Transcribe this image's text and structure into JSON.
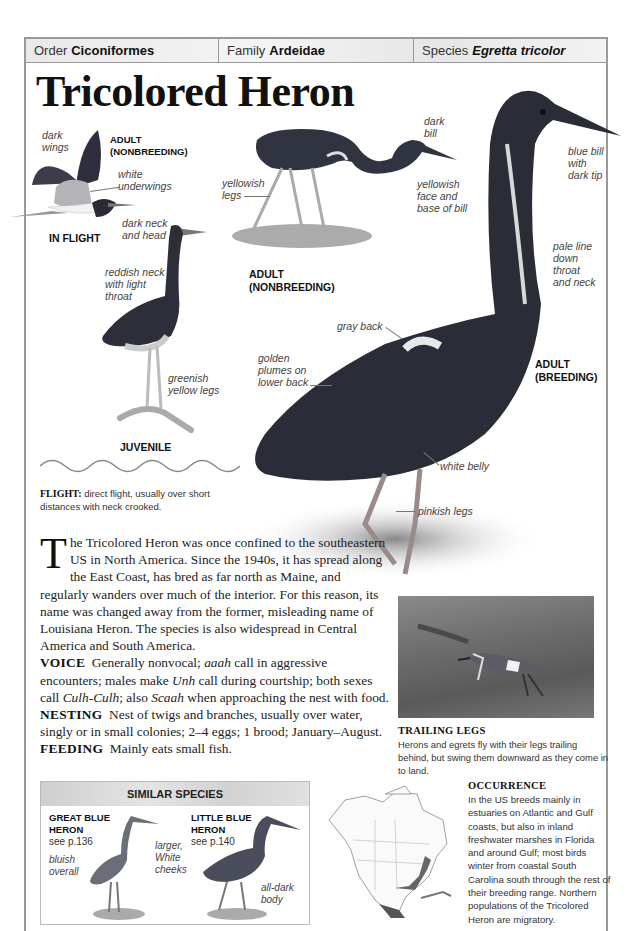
{
  "taxonomy": {
    "order_label": "Order",
    "order_value": "Ciconiformes",
    "family_label": "Family",
    "family_value": "Ardeidae",
    "species_label": "Species",
    "species_value": "Egretta tricolor"
  },
  "title": "Tricolored Heron",
  "illustrations": {
    "in_flight": {
      "caption": "IN FLIGHT",
      "age_label_1": "ADULT",
      "age_label_2": "(NONBREEDING)",
      "labels": {
        "dark_wings_1": "dark",
        "dark_wings_2": "wings",
        "white_underwings_1": "white",
        "white_underwings_2": "underwings",
        "dark_neck_1": "dark neck",
        "dark_neck_2": "and head"
      }
    },
    "adult_nonbreeding": {
      "caption_1": "ADULT",
      "caption_2": "(NONBREEDING)",
      "labels": {
        "yellowish_legs_1": "yellowish",
        "yellowish_legs_2": "legs",
        "dark_bill_1": "dark",
        "dark_bill_2": "bill",
        "face_1": "yellowish",
        "face_2": "face and",
        "face_3": "base of bill"
      }
    },
    "juvenile": {
      "caption": "JUVENILE",
      "labels": {
        "neck_1": "reddish neck",
        "neck_2": "with light",
        "neck_3": "throat",
        "legs_1": "greenish",
        "legs_2": "yellow legs"
      }
    },
    "adult_breeding": {
      "caption_1": "ADULT",
      "caption_2": "(BREEDING)",
      "labels": {
        "bill_1": "blue bill",
        "bill_2": "with",
        "bill_3": "dark tip",
        "pale_1": "pale line",
        "pale_2": "down",
        "pale_3": "throat",
        "pale_4": "and neck",
        "gray_back": "gray back",
        "golden_1": "golden",
        "golden_2": "plumes on",
        "golden_3": "lower back",
        "white_belly": "white belly",
        "pinkish_legs": "pinkish legs"
      }
    }
  },
  "flight": {
    "heading": "FLIGHT:",
    "text": "direct flight, usually over short distances with neck crooked."
  },
  "description": {
    "dropcap": "T",
    "intro": "he Tricolored Heron was once confined to the southeastern US in North America. Since the 1940s, it has spread along the East Coast, has bred as far north as Maine, and regularly wanders over much of the interior. For this reason, its name was changed away from the former, misleading name of Louisiana Heron. The species is also widespread in Central America and South America.",
    "voice_label": "VOICE",
    "voice_1": "Generally nonvocal;",
    "voice_aaah": "aaah",
    "voice_2": "call in aggressive encounters; males make",
    "voice_unh": "Unh",
    "voice_3": "call during courtship; both sexes call",
    "voice_culh": "Culh-Culh",
    "voice_4": "; also",
    "voice_scaah": "Scaah",
    "voice_5": "when approaching the nest with food.",
    "nesting_label": "NESTING",
    "nesting": "Nest of twigs and branches, usually over water, singly or in small colonies; 2–4 eggs; 1 brood; January–August.",
    "feeding_label": "FEEDING",
    "feeding": "Mainly eats small fish."
  },
  "trailing_legs": {
    "title": "TRAILING LEGS",
    "text": "Herons and egrets fly with their legs trailing behind, but swing them downward as they come in to land."
  },
  "similar_species": {
    "heading": "SIMILAR SPECIES",
    "great_blue": {
      "name_1": "GREAT BLUE",
      "name_2": "HERON",
      "page": "see p.136",
      "label_bluish_1": "bluish",
      "label_bluish_2": "overall",
      "label_larger_1": "larger,",
      "label_larger_2": "White",
      "label_larger_3": "cheeks"
    },
    "little_blue": {
      "name_1": "LITTLE BLUE",
      "name_2": "HERON",
      "page": "see p.140",
      "label_body_1": "all-dark",
      "label_body_2": "body"
    }
  },
  "occurrence": {
    "title": "OCCURRENCE",
    "text": "In the US breeds mainly in estuaries on Atlantic and Gulf coasts, but also in inland freshwater marshes in Florida and around Gulf; most birds winter from coastal South Carolina south through the rest of their breeding range. Northern populations of the Tricolored Heron are migratory."
  },
  "colors": {
    "frame": "#9a9a9a",
    "header_band": "#ececec",
    "text": "#222222",
    "label": "#444444"
  }
}
